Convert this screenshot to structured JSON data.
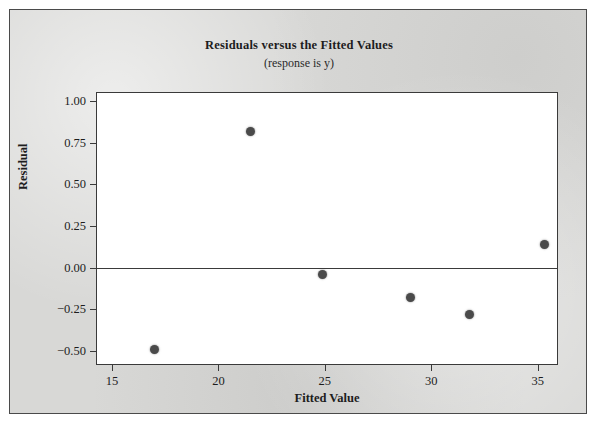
{
  "figure": {
    "background_color": "#d8d8d6",
    "plot_background_color": "#ffffff",
    "border_color": "#4a4a4a"
  },
  "chart_data": {
    "type": "scatter",
    "title": "Residuals versus the Fitted Values",
    "subtitle": "(response is y)",
    "xlabel": "Fitted Value",
    "ylabel": "Residual",
    "xlim": [
      14.3,
      35.9
    ],
    "ylim": [
      -0.58,
      1.05
    ],
    "xticks": [
      15,
      20,
      25,
      30,
      35
    ],
    "xtick_labels": [
      "15",
      "20",
      "25",
      "30",
      "35"
    ],
    "yticks": [
      1.0,
      0.75,
      0.5,
      0.25,
      0.0,
      -0.25,
      -0.5
    ],
    "ytick_labels": [
      "1.00",
      "0.75",
      "0.50",
      "0.25",
      "0.00",
      "−0.25",
      "−0.50"
    ],
    "grid": false,
    "legend": false,
    "reference_line": {
      "orientation": "horizontal",
      "y": 0.0,
      "color": "#3a3a3a"
    },
    "marker": {
      "shape": "circle",
      "color": "#4a4a4a",
      "size": 9
    },
    "x": [
      17.0,
      21.5,
      24.9,
      29.0,
      31.8,
      35.3
    ],
    "y": [
      -0.49,
      0.82,
      -0.04,
      -0.18,
      -0.28,
      0.14
    ],
    "points": [
      {
        "x": 17.0,
        "y": -0.49
      },
      {
        "x": 21.5,
        "y": 0.82
      },
      {
        "x": 24.9,
        "y": -0.04
      },
      {
        "x": 29.0,
        "y": -0.18
      },
      {
        "x": 31.8,
        "y": -0.28
      },
      {
        "x": 35.3,
        "y": 0.14
      }
    ]
  }
}
